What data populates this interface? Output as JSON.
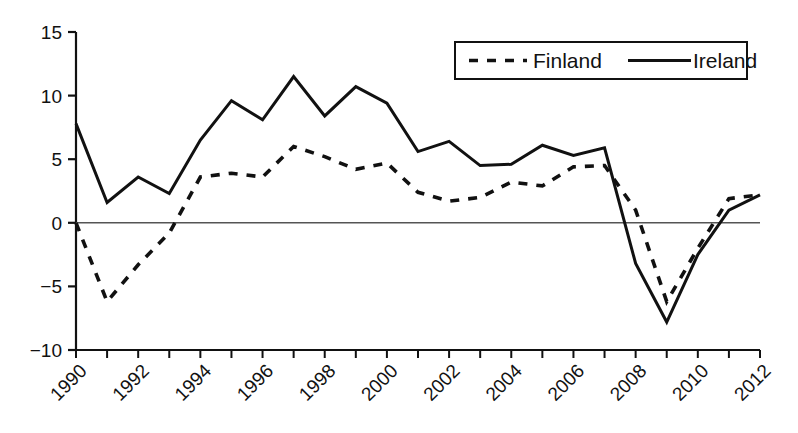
{
  "chart_data": {
    "type": "line",
    "title": "",
    "subtitle": "",
    "xlabel": "",
    "ylabel": "",
    "xlim": [
      1990,
      2012
    ],
    "ylim": [
      -10,
      15
    ],
    "grid": false,
    "legend_position": "top-right",
    "y_ticks": [
      15,
      10,
      5,
      0,
      -5,
      -10
    ],
    "y_tick_labels": [
      "15",
      "10",
      "5",
      "0",
      "−5",
      "−10"
    ],
    "x": [
      1990,
      1991,
      1992,
      1993,
      1994,
      1995,
      1996,
      1997,
      1998,
      1999,
      2000,
      2001,
      2002,
      2003,
      2004,
      2005,
      2006,
      2007,
      2008,
      2009,
      2010,
      2011,
      2012
    ],
    "x_tick_labels": [
      "1990",
      "1992",
      "1994",
      "1996",
      "1998",
      "2000",
      "2002",
      "2004",
      "2006",
      "2008",
      "2010",
      "2012"
    ],
    "x_tick_values": [
      1990,
      1992,
      1994,
      1996,
      1998,
      2000,
      2002,
      2004,
      2006,
      2008,
      2010,
      2012
    ],
    "series": [
      {
        "name": "Finland",
        "style": "dashed",
        "color": "#111111",
        "values": [
          0.0,
          -6.2,
          -3.3,
          -0.8,
          3.6,
          3.9,
          3.6,
          6.2,
          5.2,
          4.4,
          5.3,
          2.3,
          1.8,
          2.0,
          4.1,
          2.9,
          4.4,
          5.3,
          0.7,
          -8.3,
          3.0,
          2.6,
          -1.4
        ]
      },
      {
        "name": "Ireland",
        "style": "solid",
        "color": "#111111",
        "values": [
          7.8,
          1.6,
          3.6,
          2.3,
          6.5,
          9.6,
          8.1,
          11.5,
          8.4,
          10.7,
          9.4,
          5.6,
          6.4,
          4.6,
          4.6,
          6.1,
          5.5,
          5.9,
          -4.5,
          -7.8,
          -0.3,
          2.0,
          2.2
        ]
      }
    ],
    "rendered_points": {
      "Finland": [
        0.0,
        -6.2,
        -3.3,
        -0.8,
        3.6,
        3.9,
        3.6,
        6.0,
        5.2,
        4.2,
        4.7,
        2.4,
        1.7,
        2.0,
        3.2,
        2.9,
        4.4,
        4.5,
        1.0,
        -6.2,
        -2.0,
        1.9,
        2.2
      ],
      "Ireland": [
        7.8,
        1.6,
        3.6,
        2.3,
        6.5,
        9.6,
        8.1,
        11.5,
        8.4,
        10.7,
        9.4,
        5.6,
        6.4,
        4.5,
        4.6,
        6.1,
        5.3,
        5.9,
        -3.2,
        -7.8,
        -2.5,
        1.0,
        2.2
      ]
    },
    "zero_line": 0,
    "annotations": []
  },
  "legend": {
    "entries": [
      {
        "label": "Finland",
        "style": "dashed"
      },
      {
        "label": "Ireland",
        "style": "solid"
      }
    ]
  },
  "colors": {
    "line": "#111111",
    "axis": "#111111",
    "zero_line": "#555555",
    "background": "#ffffff",
    "legend_border": "#111111"
  }
}
